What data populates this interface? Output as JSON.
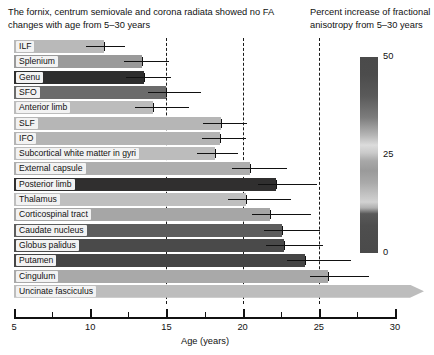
{
  "caption": "The fornix, centrum semiovale and corona radiata showed no FA changes with age from 5–30 years",
  "legend": {
    "title": "Percent increase of fractional anisotropy from 5–30 years",
    "ticks": [
      {
        "label": "50",
        "value": 50
      },
      {
        "label": "25",
        "value": 25
      },
      {
        "label": "0",
        "value": 0
      }
    ]
  },
  "axis": {
    "title": "Age (years)",
    "min": 5,
    "max": 30,
    "major_ticks": [
      5,
      10,
      15,
      20,
      25,
      30
    ],
    "major_labels": [
      "5",
      "10",
      "15",
      "20",
      "25",
      "30"
    ],
    "minor_ticks": [
      7.5,
      12.5,
      17.5,
      22.5,
      27.5
    ],
    "reference_lines": [
      15,
      20,
      25
    ]
  },
  "chart_data": {
    "type": "bar",
    "orientation": "horizontal",
    "title": "The fornix, centrum semiovale and corona radiata showed no FA changes with age from 5–30 years",
    "xlabel": "Age (years)",
    "ylabel": "",
    "xlim": [
      5,
      30
    ],
    "grid": false,
    "legend_position": "right",
    "colorbar_label": "Percent increase of fractional anisotropy from 5–30 years",
    "colorbar_range": [
      0,
      50
    ],
    "value_meaning": "Age (years) at which fractional anisotropy reaches maturation plateau",
    "color_meaning": "Percent increase of fractional anisotropy from 5–30 years",
    "categories": [
      "ILF",
      "Splenium",
      "Genu",
      "SFO",
      "Anterior limb",
      "SLF",
      "IFO",
      "Subcortical white matter in gyri",
      "External capsule",
      "Posterior limb",
      "Thalamus",
      "Corticospinal tract",
      "Caudate nucleus",
      "Globus palidus",
      "Putamen",
      "Cingulum",
      "Uncinate fasciculus"
    ],
    "values": [
      10.9,
      13.4,
      13.5,
      15.0,
      14.1,
      18.6,
      18.5,
      18.2,
      20.5,
      22.2,
      20.2,
      21.8,
      22.6,
      22.7,
      24.1,
      25.6,
      30.5
    ],
    "errors_upper": [
      12.3,
      15.2,
      15.3,
      17.3,
      16.5,
      20.3,
      20.2,
      19.7,
      22.9,
      24.9,
      23.2,
      24.5,
      25.1,
      25.3,
      27.1,
      28.3,
      30.5
    ],
    "color_values": [
      22,
      26,
      48,
      35,
      20,
      22,
      23,
      21,
      24,
      47,
      20,
      25,
      38,
      42,
      44,
      24,
      20
    ],
    "colors": [
      "#b9b9b9",
      "#9a9a9a",
      "#2e2e2e",
      "#6b6b6b",
      "#bcbcbc",
      "#b6b6b6",
      "#b4b4b4",
      "#bcbcbc",
      "#aeaeae",
      "#302f2f",
      "#bfbfbf",
      "#a6a6a6",
      "#5d5d5d",
      "#4a4a4a",
      "#454545",
      "#a9a9a9",
      "#bdbdbd"
    ],
    "arrow_bars": [
      "Uncinate fasciculus"
    ]
  }
}
